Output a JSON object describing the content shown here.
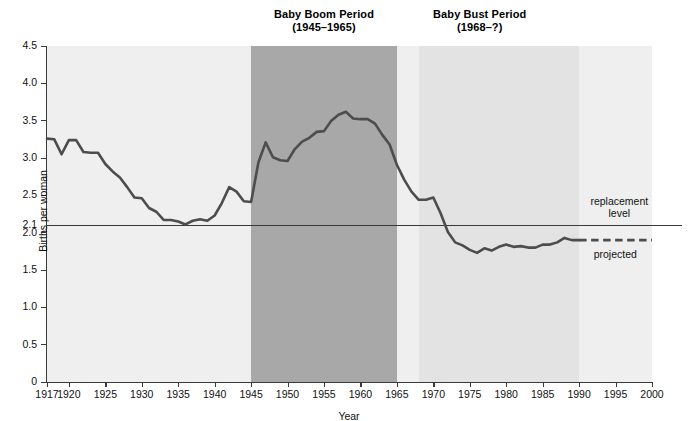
{
  "figure": {
    "y_axis_title": "Births per woman",
    "x_axis_title": "Year"
  },
  "annotations": {
    "boom_title": "Baby Boom Period",
    "boom_years": "(1945–1965)",
    "bust_title": "Baby Bust Period",
    "bust_years": "(1968–?)",
    "replacement_line1": "replacement",
    "replacement_line2": "level",
    "projected": "projected"
  },
  "colors": {
    "plot_background": "#efefef",
    "boom_band": "#a8a8a8",
    "bust_band": "#e3e3e3",
    "line": "#4d4d4d",
    "axis": "#3a3a3a"
  },
  "chart_data": {
    "type": "line",
    "xlabel": "Year",
    "ylabel": "Births per woman",
    "xlim": [
      1917,
      2000
    ],
    "ylim": [
      0,
      4.5
    ],
    "grid": false,
    "legend_position": "none",
    "y_ticks": [
      0,
      0.5,
      1.0,
      1.5,
      2.0,
      2.1,
      2.5,
      3.0,
      3.5,
      4.0,
      4.5
    ],
    "y_tick_labels": [
      "0",
      "0.5",
      "1.0",
      "1.5",
      "2.0",
      "2.1",
      "2.5",
      "3.0",
      "3.5",
      "4.0",
      "4.5"
    ],
    "x_ticks": [
      1917,
      1920,
      1925,
      1930,
      1935,
      1940,
      1945,
      1950,
      1955,
      1960,
      1965,
      1970,
      1975,
      1980,
      1985,
      1990,
      1995,
      2000
    ],
    "x_tick_labels": [
      "1917",
      "1920",
      "1925",
      "1930",
      "1935",
      "1940",
      "1945",
      "1950",
      "1955",
      "1960",
      "1965",
      "1970",
      "1975",
      "1980",
      "1985",
      "1990",
      "1995",
      "2000"
    ],
    "reference_lines": [
      {
        "name": "replacement level",
        "y": 2.1,
        "style": "solid"
      }
    ],
    "shaded_regions": [
      {
        "name": "Baby Boom Period",
        "x0": 1945,
        "x1": 1965,
        "color": "#a8a8a8"
      },
      {
        "name": "Baby Bust Period",
        "x0": 1968,
        "x1": 1990,
        "color": "#e3e3e3"
      }
    ],
    "series": [
      {
        "name": "Total fertility rate (actual)",
        "style": "solid",
        "x": [
          1917,
          1918,
          1919,
          1920,
          1921,
          1922,
          1923,
          1924,
          1925,
          1926,
          1927,
          1928,
          1929,
          1930,
          1931,
          1932,
          1933,
          1934,
          1935,
          1936,
          1937,
          1938,
          1939,
          1940,
          1941,
          1942,
          1943,
          1944,
          1945,
          1946,
          1947,
          1948,
          1949,
          1950,
          1951,
          1952,
          1953,
          1954,
          1955,
          1956,
          1957,
          1958,
          1959,
          1960,
          1961,
          1962,
          1963,
          1964,
          1965,
          1966,
          1967,
          1968,
          1969,
          1970,
          1971,
          1972,
          1973,
          1974,
          1975,
          1976,
          1977,
          1978,
          1979,
          1980,
          1981,
          1982,
          1983,
          1984,
          1985,
          1986,
          1987,
          1988,
          1989,
          1990
        ],
        "values": [
          3.26,
          3.25,
          3.05,
          3.24,
          3.24,
          3.08,
          3.07,
          3.07,
          2.92,
          2.82,
          2.74,
          2.61,
          2.47,
          2.46,
          2.33,
          2.28,
          2.17,
          2.17,
          2.15,
          2.11,
          2.16,
          2.18,
          2.16,
          2.23,
          2.4,
          2.61,
          2.55,
          2.42,
          2.41,
          2.94,
          3.21,
          3.01,
          2.97,
          2.96,
          3.12,
          3.22,
          3.27,
          3.35,
          3.36,
          3.5,
          3.58,
          3.62,
          3.53,
          3.52,
          3.52,
          3.46,
          3.31,
          3.18,
          2.91,
          2.71,
          2.55,
          2.44,
          2.44,
          2.47,
          2.26,
          2.01,
          1.87,
          1.83,
          1.77,
          1.73,
          1.79,
          1.76,
          1.81,
          1.84,
          1.81,
          1.82,
          1.8,
          1.8,
          1.84,
          1.84,
          1.87,
          1.93,
          1.9,
          1.9
        ]
      },
      {
        "name": "Total fertility rate (projected)",
        "style": "dashed",
        "x": [
          1990,
          1992,
          1994,
          1996,
          1998,
          2000
        ],
        "values": [
          1.9,
          1.9,
          1.9,
          1.9,
          1.9,
          1.9
        ]
      }
    ]
  }
}
